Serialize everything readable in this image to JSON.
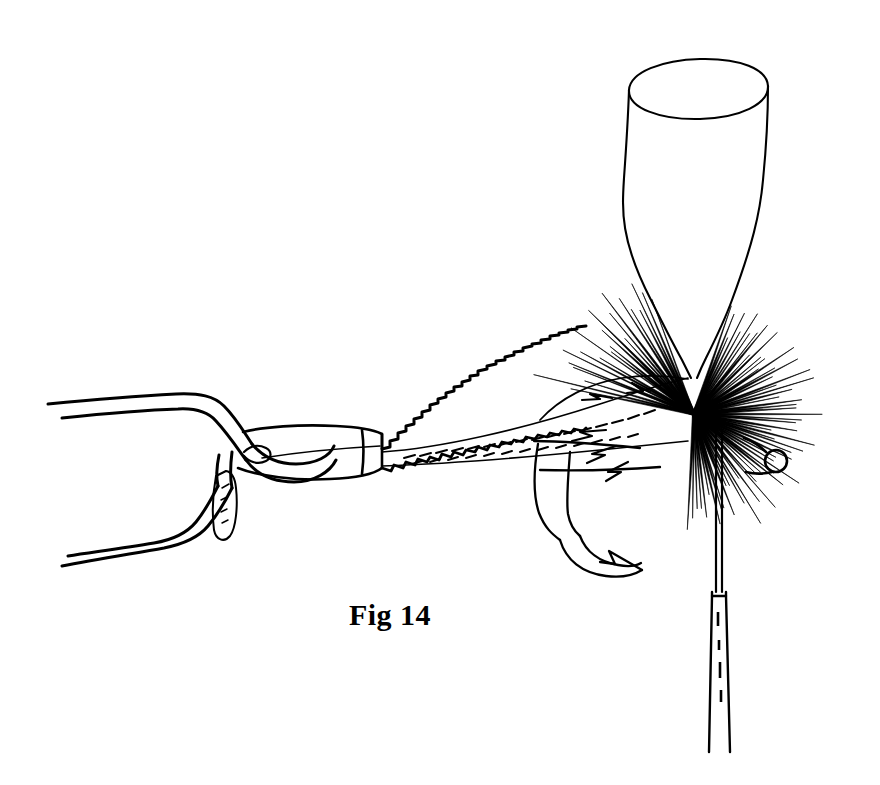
{
  "figure": {
    "caption": "Fig 14",
    "background_color": "#ffffff",
    "ink_color": "#000000",
    "width": 880,
    "height": 785,
    "style": "black-and-white line drawing"
  },
  "parts": {
    "hackle_pliers": {
      "label": "hackle-pliers",
      "description": "wire spring hackle pliers with two tapered handle wires and a flat gripping jaw"
    },
    "pliers_jaw": {
      "label": "pliers-jaw",
      "description": "flat tapered jaw clamping the tip of the hackle feather"
    },
    "hackle_feather": {
      "label": "hackle-feather",
      "description": "feather stem with sawtooth barbs along the upper and lower edges running from the jaw to the collar"
    },
    "hackle_collar": {
      "label": "hackle-collar",
      "description": "dense radiating fan of hackle fibres wound around the hook shank"
    },
    "hook": {
      "label": "fish-hook",
      "description": "hook shank with a downward bend ending in a barbed point, and a small round eye at the right"
    },
    "hook_eye": {
      "label": "hook-eye",
      "description": "small circular ring at the right end of the hook shank"
    },
    "hook_barb": {
      "label": "hook-barb",
      "description": "arrow-like barb at the hook point"
    },
    "bobbin": {
      "label": "bobbin-cone",
      "description": "tapered cone / open-topped tube of the thread bobbin above the fly"
    },
    "bobbin_tube": {
      "label": "bobbin-tube",
      "description": "narrow vertical bobbin tube with thread descending below the hook"
    },
    "tying_thread": {
      "label": "tying-thread",
      "description": "thread running from the collar down through the bobbin tube"
    }
  }
}
